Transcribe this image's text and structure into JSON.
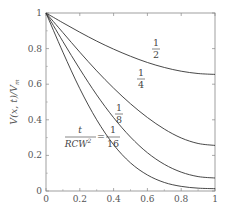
{
  "chart_data": {
    "type": "line",
    "title": "",
    "xlabel": "x/W",
    "ylabel": "V(x, t)/V_m",
    "xlim": [
      0,
      1
    ],
    "ylim": [
      0,
      1
    ],
    "grid": false,
    "legend": "inline curve labels",
    "x_ticks": [
      "0",
      "0.2",
      "0.4",
      "0.6",
      "0.8",
      "1"
    ],
    "y_ticks": [
      "0",
      "0.2",
      "0.4",
      "0.6",
      "0.8",
      "1"
    ],
    "annotation": "t / RCW² = 1/16",
    "x": [
      0,
      0.1,
      0.2,
      0.3,
      0.4,
      0.5,
      0.6,
      0.7,
      0.8,
      0.9,
      1.0
    ],
    "series": [
      {
        "name": "1/2",
        "label_num": "1",
        "label_den": "2",
        "values": [
          1.0,
          0.945,
          0.892,
          0.842,
          0.797,
          0.757,
          0.722,
          0.694,
          0.673,
          0.66,
          0.655
        ]
      },
      {
        "name": "1/4",
        "label_num": "1",
        "label_den": "4",
        "values": [
          1.0,
          0.89,
          0.78,
          0.675,
          0.578,
          0.49,
          0.413,
          0.348,
          0.298,
          0.267,
          0.256
        ]
      },
      {
        "name": "1/8",
        "label_num": "1",
        "label_den": "8",
        "values": [
          1.0,
          0.84,
          0.685,
          0.54,
          0.412,
          0.303,
          0.215,
          0.15,
          0.106,
          0.081,
          0.073
        ]
      },
      {
        "name": "1/16",
        "label_num": "1",
        "label_den": "16",
        "values": [
          1.0,
          0.78,
          0.575,
          0.4,
          0.26,
          0.158,
          0.09,
          0.048,
          0.026,
          0.016,
          0.013
        ]
      }
    ]
  },
  "labels": {
    "xlabel": "x/W",
    "ylabel": "V(x, t)/V",
    "ylabel_sub": "m",
    "annot_num": "t",
    "annot_den": "RCW",
    "annot_den_sup": "2",
    "annot_eq": "=",
    "annot_val_num": "1",
    "annot_val_den": "16"
  }
}
